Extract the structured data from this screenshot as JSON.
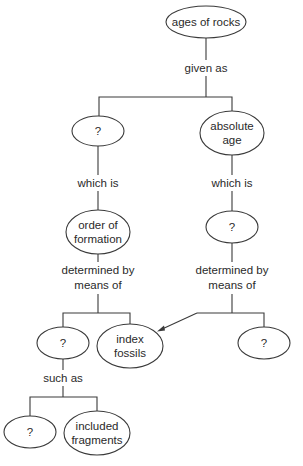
{
  "diagram": {
    "type": "concept-map",
    "nodes": {
      "root": {
        "lines": [
          "ages of rocks"
        ]
      },
      "relative_unknown": {
        "lines": [
          "?"
        ]
      },
      "absolute_age": {
        "lines": [
          "absolute",
          "age"
        ]
      },
      "order_of_formation": {
        "lines": [
          "order of",
          "formation"
        ]
      },
      "absolute_unknown": {
        "lines": [
          "?"
        ]
      },
      "method_unknown": {
        "lines": [
          "?"
        ]
      },
      "index_fossils": {
        "lines": [
          "index",
          "fossils"
        ]
      },
      "absolute_method_unknown": {
        "lines": [
          "?"
        ]
      },
      "example_unknown": {
        "lines": [
          "?"
        ]
      },
      "included_fragments": {
        "lines": [
          "included",
          "fragments"
        ]
      }
    },
    "links": {
      "given_as": {
        "lines": [
          "given as"
        ]
      },
      "which_is_left": {
        "lines": [
          "which is"
        ]
      },
      "which_is_right": {
        "lines": [
          "which is"
        ]
      },
      "determined_left": {
        "lines": [
          "determined by",
          "means of"
        ]
      },
      "determined_right": {
        "lines": [
          "determined by",
          "means of"
        ]
      },
      "such_as": {
        "lines": [
          "such as"
        ]
      }
    },
    "colors": {
      "stroke": "#3a3a3a",
      "text": "#2a2a2a",
      "background": "#ffffff"
    }
  }
}
